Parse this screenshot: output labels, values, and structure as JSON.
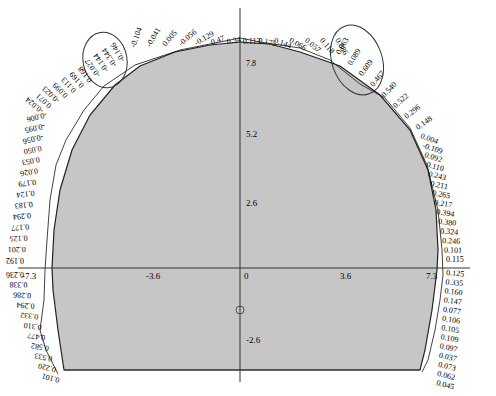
{
  "diagram": {
    "type": "tunnel-lining-cross-section",
    "colors": {
      "fill": "#c6c6c6",
      "outline": "#222222",
      "axis": "#333333",
      "text": "#111111",
      "background": "#ffffff"
    },
    "axes": {
      "x_ticks": [
        {
          "label": "-7.3",
          "value": -7.3
        },
        {
          "label": "-3.6",
          "value": -3.6
        },
        {
          "label": "0",
          "value": 0
        },
        {
          "label": "3.6",
          "value": 3.6
        },
        {
          "label": "7.3",
          "value": 7.3
        }
      ],
      "y_ticks": [
        {
          "label": "5.2",
          "value": 5.2
        },
        {
          "label": "2.6",
          "value": 2.6
        },
        {
          "label": "-2.6",
          "value": -2.6
        }
      ],
      "crown_label": "7.8"
    },
    "values": {
      "left_crown": [
        "-0.146",
        "-0.344",
        "-0.144",
        "-0.027",
        "0.168",
        "0.169",
        "0.113",
        "0.099",
        "-0.023",
        "0.071",
        "-0.024"
      ],
      "top": [
        "-0.104",
        "-0.041",
        "0.005",
        "-0.056",
        "-0.129",
        "0.47",
        "0.34",
        "0.113",
        "0.175",
        "0.144",
        "0.066",
        "0.057",
        "0.118",
        "0.086"
      ],
      "right_crown": [
        "0.063",
        "0.089",
        "0.609",
        "0.467",
        "0.540",
        "0.522",
        "0.296",
        "0.148"
      ],
      "right_wall": [
        "0.004",
        "-0.109",
        "0.092",
        "0.110",
        "0.243",
        "0.211",
        "0.265",
        "0.217",
        "0.394",
        "0.380",
        "0.324",
        "0.246",
        "0.101",
        "0.115"
      ],
      "right_lower": [
        "0.125",
        "0.335",
        "0.160",
        "0.147",
        "0.077",
        "0.106",
        "0.105",
        "0.109",
        "0.097",
        "0.037",
        "0.073",
        "0.062",
        "0.045"
      ],
      "left_wall": [
        "-0.006",
        "-0.095",
        "-0.056",
        "0.050",
        "0.053",
        "0.026",
        "0.179",
        "0.124",
        "0.183",
        "0.294",
        "0.177",
        "0.125",
        "0.201",
        "0.192"
      ],
      "left_lower": [
        "0.236",
        "0.338",
        "0.286",
        "0.294",
        "0.332",
        "0.310",
        "0.477",
        "0.582",
        "0.533",
        "0.220",
        "0.101"
      ]
    },
    "annotations": [
      {
        "type": "ellipse",
        "name": "left-shoulder-highlight"
      },
      {
        "type": "ellipse",
        "name": "right-shoulder-highlight"
      }
    ]
  }
}
